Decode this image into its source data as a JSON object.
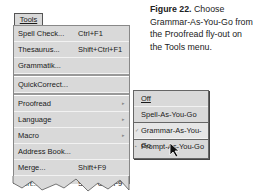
{
  "menubar": {
    "tools_label": "Tools"
  },
  "menu": {
    "items": [
      {
        "label": "Spell Check...",
        "shortcut": "Ctrl+F1"
      },
      {
        "label": "Thesaurus...",
        "shortcut": "Shift+Ctrl+F1"
      },
      {
        "label": "Grammatik..."
      },
      {
        "label": "QuickCorrect..."
      },
      {
        "label": "Proofread",
        "submenu": true
      },
      {
        "label": "Language",
        "submenu": true
      },
      {
        "label": "Macro",
        "submenu": true
      },
      {
        "label": "Address Book..."
      },
      {
        "label": "Merge...",
        "shortcut": "Shift+F9"
      },
      {
        "label": "Sort...",
        "shortcut": "Shift+Ctrl+F9"
      }
    ]
  },
  "flyout": {
    "items": [
      {
        "label": "Off"
      },
      {
        "label": "Spell-As-You-Go"
      },
      {
        "label": "Grammar-As-You-Go",
        "selected": true
      },
      {
        "label": "Prompt-As-You-Go"
      }
    ]
  },
  "caption": {
    "figure": "Figure 22.",
    "text": "Choose Grammar-As-You-Go from the Proofread fly-out on the Tools menu."
  },
  "icons": {
    "submenu_arrow": "▸",
    "check": "✓"
  }
}
